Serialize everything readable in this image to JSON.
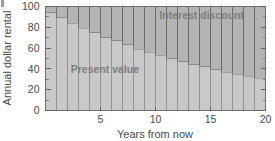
{
  "chart_data": {
    "type": "bar",
    "subtype": "stacked-bar",
    "title": "",
    "xlabel": "Years from now",
    "ylabel": "Annual dollar rental",
    "xlim": [
      0,
      20
    ],
    "ylim": [
      0,
      100
    ],
    "grid": false,
    "legend_position": "in-plot-annotations",
    "x_ticks": [
      5,
      10,
      15,
      20
    ],
    "x_tick_labels": [
      "5",
      "10",
      "15",
      "20"
    ],
    "y_ticks": [
      0,
      20,
      40,
      60,
      80,
      100
    ],
    "y_tick_labels": [
      "0",
      "20",
      "40",
      "60",
      "80",
      "100"
    ],
    "y_minor_ticks": [
      10,
      30,
      50,
      70,
      90
    ],
    "categories": [
      1,
      2,
      3,
      4,
      5,
      6,
      7,
      8,
      9,
      10,
      11,
      12,
      13,
      14,
      15,
      16,
      17,
      18,
      19,
      20
    ],
    "series": [
      {
        "name": "Present value",
        "color": "#c9c9c9",
        "edge_color": "#8d8d8d",
        "values": [
          94,
          89,
          84,
          79,
          75,
          70,
          67,
          63,
          59,
          56,
          53,
          50,
          47,
          44,
          42,
          39,
          37,
          35,
          33,
          31
        ]
      },
      {
        "name": "Interest discount",
        "color": "#b4b4b4",
        "edge_color": "#6a6a6a",
        "values": [
          6,
          11,
          16,
          21,
          25,
          30,
          33,
          37,
          41,
          44,
          47,
          50,
          53,
          56,
          58,
          61,
          63,
          65,
          67,
          69
        ]
      }
    ],
    "annotations": [
      {
        "text": "Interest discount",
        "x_value": 14.2,
        "y_value": 88,
        "color": "#7d7d7d"
      },
      {
        "text": "Present value",
        "x_value": 5.4,
        "y_value": 36,
        "color": "#7d7d7d"
      }
    ],
    "total_value": 100
  },
  "labels": {
    "y_axis_title": "Annual dollar rental",
    "x_axis_title": "Years from now",
    "series_one": "Present value",
    "series_two": "Interest discount"
  },
  "colors": {
    "present_value_fill": "#c9c9c9",
    "interest_discount_fill": "#b4b4b4",
    "axis": "#6e6e6e",
    "text": "#4a4a4a",
    "annotation_text": "#7d7d7d",
    "background": "#ffffff"
  }
}
